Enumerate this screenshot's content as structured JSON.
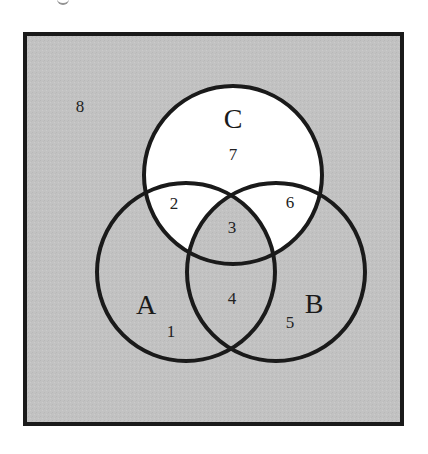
{
  "diagram": {
    "type": "venn-3-set",
    "colors": {
      "universe_fill": "#c2c2c2",
      "highlight_fill": "#ffffff",
      "stroke": "#1a1a1a"
    },
    "sets": [
      {
        "id": "A",
        "label": "A"
      },
      {
        "id": "B",
        "label": "B"
      },
      {
        "id": "C",
        "label": "C"
      }
    ],
    "regions": [
      {
        "number": "1",
        "description": "A only",
        "shaded": true
      },
      {
        "number": "2",
        "description": "A and C, not B",
        "shaded": false
      },
      {
        "number": "3",
        "description": "A and B and C",
        "shaded": true
      },
      {
        "number": "4",
        "description": "A and B, not C",
        "shaded": true
      },
      {
        "number": "5",
        "description": "B only",
        "shaded": true
      },
      {
        "number": "6",
        "description": "B and C, not A",
        "shaded": false
      },
      {
        "number": "7",
        "description": "C only",
        "shaded": false
      },
      {
        "number": "8",
        "description": "outside A, B, C",
        "shaded": true
      }
    ]
  }
}
